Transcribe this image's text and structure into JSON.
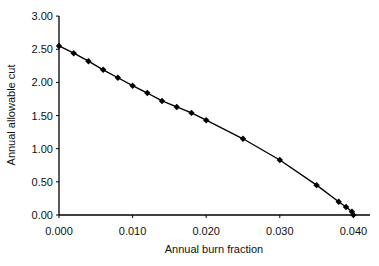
{
  "chart_data": {
    "type": "line",
    "title": "",
    "xlabel": "Annual burn fraction",
    "ylabel": "Annual allowable cut",
    "xlim": [
      0.0,
      0.042
    ],
    "ylim": [
      0.0,
      3.0
    ],
    "x_ticks": [
      "0.000",
      "0.010",
      "0.020",
      "0.030",
      "0.040"
    ],
    "y_ticks": [
      "0.00",
      "0.50",
      "1.00",
      "1.50",
      "2.00",
      "2.50",
      "3.00"
    ],
    "grid": false,
    "legend": null,
    "series": [
      {
        "name": "Annual allowable cut",
        "marker": "diamond",
        "color": "#000000",
        "x": [
          0.0,
          0.002,
          0.004,
          0.006,
          0.008,
          0.01,
          0.012,
          0.014,
          0.016,
          0.018,
          0.02,
          0.025,
          0.03,
          0.035,
          0.038,
          0.039,
          0.0398,
          0.04
        ],
        "y": [
          2.55,
          2.44,
          2.32,
          2.19,
          2.07,
          1.95,
          1.84,
          1.72,
          1.63,
          1.54,
          1.43,
          1.15,
          0.83,
          0.45,
          0.2,
          0.12,
          0.05,
          0.0
        ]
      }
    ]
  }
}
